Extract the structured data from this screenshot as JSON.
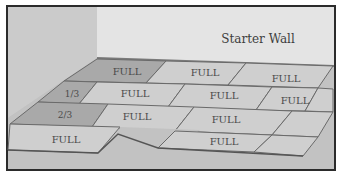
{
  "diagram": {
    "title": "Starter Wall",
    "colors": {
      "back_wall": "#e4e4e4",
      "left_wall": "#c9c9c9",
      "floor": "#c2c2c2",
      "tile_light": "#cfcfcf",
      "tile_dark": "#a9a9a9",
      "tile_edge": "#6a6a6a",
      "frame": "#2b2b2b",
      "label": "#4a4a4a"
    },
    "tiles": [
      {
        "row": 1,
        "label": "FULL",
        "shade": "dark"
      },
      {
        "row": 1,
        "label": "FULL",
        "shade": "light"
      },
      {
        "row": 1,
        "label": "FULL",
        "shade": "light"
      },
      {
        "row": 2,
        "label": "1/3",
        "shade": "dark"
      },
      {
        "row": 2,
        "label": "FULL",
        "shade": "light"
      },
      {
        "row": 2,
        "label": "FULL",
        "shade": "light"
      },
      {
        "row": 2,
        "label": "FULL",
        "shade": "light"
      },
      {
        "row": 3,
        "label": "2/3",
        "shade": "dark"
      },
      {
        "row": 3,
        "label": "FULL",
        "shade": "light"
      },
      {
        "row": 3,
        "label": "FULL",
        "shade": "light"
      },
      {
        "row": 4,
        "label": "FULL",
        "shade": "light"
      },
      {
        "row": 4,
        "label": "FULL",
        "shade": "light"
      },
      {
        "row": 4,
        "label": "",
        "shade": "light"
      }
    ]
  }
}
